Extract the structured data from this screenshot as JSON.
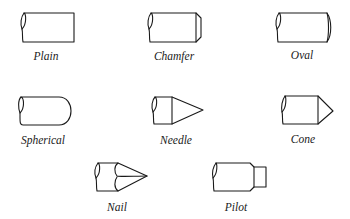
{
  "figure": {
    "type": "diagram",
    "shapes": [
      {
        "id": "plain",
        "label": "Plain"
      },
      {
        "id": "chamfer",
        "label": "Chamfer"
      },
      {
        "id": "oval",
        "label": "Oval"
      },
      {
        "id": "spherical",
        "label": "Spherical"
      },
      {
        "id": "needle",
        "label": "Needle"
      },
      {
        "id": "cone",
        "label": "Cone"
      },
      {
        "id": "nail",
        "label": "Nail"
      },
      {
        "id": "pilot",
        "label": "Pilot"
      }
    ]
  }
}
